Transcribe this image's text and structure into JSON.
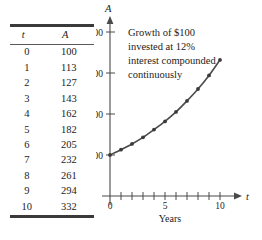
{
  "table": {
    "headers": [
      "t",
      "A"
    ],
    "rows": [
      {
        "t": "0",
        "a": "100"
      },
      {
        "t": "1",
        "a": "113"
      },
      {
        "t": "2",
        "a": "127"
      },
      {
        "t": "3",
        "a": "143"
      },
      {
        "t": "4",
        "a": "162"
      },
      {
        "t": "5",
        "a": "182"
      },
      {
        "t": "6",
        "a": "205"
      },
      {
        "t": "7",
        "a": "232"
      },
      {
        "t": "8",
        "a": "261"
      },
      {
        "t": "9",
        "a": "294"
      },
      {
        "t": "10",
        "a": "332"
      }
    ]
  },
  "annotation": {
    "lines": [
      "Growth of $100",
      "invested at 12%",
      "interest compounded",
      "continuously"
    ]
  },
  "axes": {
    "y_name": "A",
    "x_name": "t",
    "x_caption": "Years",
    "y_ticks": [
      "$400",
      "300",
      "200",
      "100"
    ],
    "x_ticks": [
      "0",
      "5",
      "10"
    ]
  },
  "chart_data": {
    "type": "line",
    "xlabel": "Years",
    "ylabel": "A",
    "x": [
      0,
      1,
      2,
      3,
      4,
      5,
      6,
      7,
      8,
      9,
      10
    ],
    "values": [
      100,
      113,
      127,
      143,
      162,
      182,
      205,
      232,
      261,
      294,
      332
    ],
    "series": [
      {
        "name": "A",
        "values": [
          100,
          113,
          127,
          143,
          162,
          182,
          205,
          232,
          261,
          294,
          332
        ]
      }
    ],
    "xlim": [
      0,
      11
    ],
    "ylim": [
      0,
      420
    ],
    "x_tick_values": [
      0,
      1,
      2,
      3,
      4,
      5,
      6,
      7,
      8,
      9,
      10
    ],
    "x_labeled_ticks": [
      0,
      5,
      10
    ],
    "y_tick_values": [
      100,
      200,
      300,
      400
    ],
    "y_tick_labels": [
      "100",
      "200",
      "300",
      "$400"
    ],
    "grid": false,
    "legend": "none",
    "markers": "circle",
    "colors": {
      "line": "#4a4a4a",
      "marker": "#3a3a3a",
      "axis": "#4a4a4a"
    }
  }
}
